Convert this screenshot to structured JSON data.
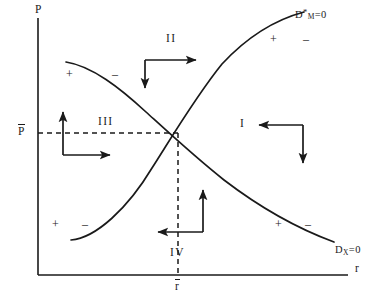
{
  "figure": {
    "type": "phase-diagram",
    "background": "#ffffff",
    "ink_color": "#1a1a1a"
  },
  "axes": {
    "y_axis_label": "P",
    "x_axis_label": "r",
    "y_tick_label": "P",
    "y_tick_label_overbar": true,
    "x_tick_label": "r",
    "x_tick_label_overbar": true,
    "origin": [
      38,
      275
    ],
    "x_axis_end": [
      348,
      275
    ],
    "y_axis_top": [
      38,
      18
    ]
  },
  "curves": [
    {
      "id": "dm-curve",
      "label_base": "D",
      "label_sup": "*",
      "label_sub": "M",
      "label_eq": "=0",
      "label_full": "D*M=0",
      "shape": "upward-sloping-convex",
      "description": "rising money-market equilibrium locus"
    },
    {
      "id": "dx-curve",
      "label_base": "D",
      "label_sup": "",
      "label_sub": "X",
      "label_eq": "=0",
      "label_full": "DX=0",
      "shape": "downward-sloping-convex",
      "description": "falling goods-market equilibrium locus"
    }
  ],
  "equilibrium": {
    "point": [
      178,
      133
    ],
    "dashed_horizontal": true,
    "dashed_vertical": true
  },
  "regions": [
    {
      "id": "I",
      "label": "I",
      "arrows": [
        "left",
        "down"
      ]
    },
    {
      "id": "II",
      "label": "II",
      "arrows": [
        "right",
        "down"
      ]
    },
    {
      "id": "III",
      "label": "III",
      "arrows": [
        "up",
        "right"
      ]
    },
    {
      "id": "IV",
      "label": "IV",
      "arrows": [
        "up",
        "left"
      ]
    }
  ],
  "signs": {
    "dx_upper_left": {
      "plus": "+",
      "minus": "–"
    },
    "dx_lower_right": {
      "plus": "+",
      "minus": "–"
    },
    "dm_lower_left": {
      "plus": "+",
      "minus": "–"
    },
    "dm_upper_right": {
      "plus": "+",
      "minus": "–"
    }
  }
}
